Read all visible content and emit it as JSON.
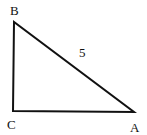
{
  "diagram": {
    "type": "right-triangle",
    "vertices": {
      "A": {
        "label": "A",
        "x": 134,
        "y": 112
      },
      "B": {
        "label": "B",
        "x": 14,
        "y": 22
      },
      "C": {
        "label": "C",
        "x": 13,
        "y": 111
      }
    },
    "sides": {
      "AB": {
        "label": "5"
      }
    },
    "right_angle_at": "C",
    "stroke_color": "#111111",
    "background": "#ffffff"
  }
}
